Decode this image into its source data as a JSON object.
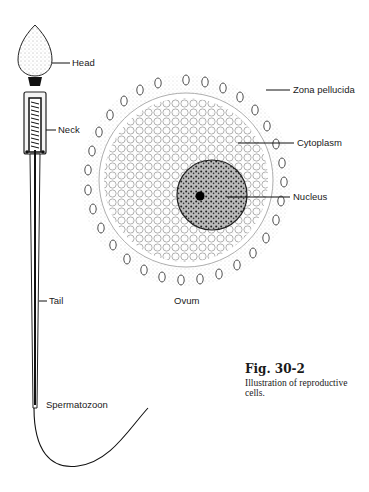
{
  "figure": {
    "number": "Fig. 30-2",
    "caption": "Illustration of reproductive cells."
  },
  "sperm": {
    "title": "Spermatozoon",
    "labels": {
      "head": "Head",
      "neck": "Neck",
      "tail": "Tail"
    }
  },
  "ovum": {
    "title": "Ovum",
    "labels": {
      "zona": "Zona pellucida",
      "cytoplasm": "Cytoplasm",
      "nucleus": "Nucleus"
    }
  }
}
